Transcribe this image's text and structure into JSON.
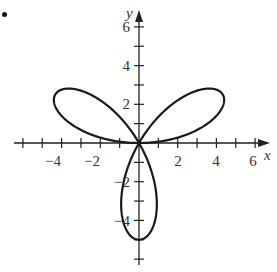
{
  "chart_data": {
    "type": "line",
    "title": "",
    "xlabel": "x",
    "ylabel": "y",
    "xlim": [
      -6,
      6
    ],
    "ylim": [
      -6,
      6
    ],
    "x_ticks": [
      -6,
      -5,
      -4,
      -3,
      -2,
      -1,
      0,
      1,
      2,
      3,
      4,
      5,
      6
    ],
    "y_ticks": [
      -6,
      -5,
      -4,
      -3,
      -2,
      -1,
      0,
      1,
      2,
      3,
      4,
      5,
      6
    ],
    "x_tick_labels": [
      "-4",
      "-2",
      "2",
      "4",
      "6"
    ],
    "y_tick_labels": [
      "6",
      "4",
      "2",
      "-2",
      "-4"
    ],
    "grid": false,
    "legend": null,
    "series": [
      {
        "name": "r = 5 sin(3θ)",
        "petals": 3,
        "petal_length": 5,
        "petal_tips": [
          [
            4.33,
            2.5
          ],
          [
            -4.33,
            2.5
          ],
          [
            0,
            -5
          ]
        ]
      }
    ]
  },
  "labels": {
    "x_axis": "x",
    "y_axis": "y",
    "xt": {
      "m4": "−4",
      "m2": "−2",
      "p2": "2",
      "p4": "4",
      "p6": "6"
    },
    "yt": {
      "p6": "6",
      "p4": "4",
      "p2": "2",
      "m2": "−2",
      "m4": "−4"
    }
  }
}
